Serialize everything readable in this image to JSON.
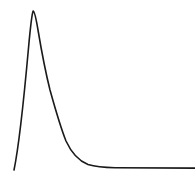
{
  "figure": {
    "name": "skewed-distribution-curve",
    "width": 195,
    "height": 178,
    "background_color": "#ffffff",
    "has_axes": false,
    "has_gridlines": false,
    "has_labels": false,
    "has_legend": false,
    "has_title": false,
    "title": "",
    "xlabel": "",
    "ylabel": ""
  },
  "style": {
    "stroke_color": "#1a1a1a",
    "stroke_width": 1.6,
    "background_color": "#ffffff"
  },
  "chart_data": {
    "type": "line",
    "title": "",
    "subtitle": "",
    "xlabel": "",
    "ylabel": "",
    "xlim": [
      0,
      195
    ],
    "ylim": [
      178,
      0
    ],
    "grid": false,
    "legend": null,
    "annotations": [],
    "tick_labels_x": [],
    "tick_labels_y": [],
    "series": [
      {
        "name": "density-curve",
        "color": "#1a1a1a",
        "x": [
          14,
          16,
          18,
          20,
          22,
          24,
          26,
          28,
          30,
          32,
          33,
          35,
          37,
          39,
          41,
          43,
          45,
          47,
          50,
          53,
          56,
          59,
          62,
          66,
          70,
          74,
          78,
          82,
          86,
          90,
          95,
          100,
          105,
          112,
          120,
          130,
          140,
          150,
          160,
          170,
          180,
          190,
          195
        ],
        "y": [
          170,
          152,
          130,
          106,
          82,
          60,
          42,
          28,
          18,
          12,
          11,
          13,
          20,
          29,
          39,
          48,
          56,
          64,
          76,
          87,
          98,
          108,
          118,
          130,
          139,
          147,
          153,
          157,
          161,
          163,
          165,
          166,
          166.6,
          167,
          167.2,
          167.4,
          167.5,
          167.6,
          167.7,
          167.8,
          167.8,
          167.9,
          167.9
        ]
      }
    ],
    "key_points": {
      "start": [
        14,
        170
      ],
      "peak": [
        33,
        11
      ],
      "knee": [
        90,
        163
      ],
      "tail_end": [
        195,
        168
      ],
      "asymptote_y": 167.9
    },
    "path_d": "M 14 170 C 19 146 24 98 28.5 48 C 30.5 26 32 13 33.2 11 C 34.5 11.5 36 18 38 30 C 41 48 45 70 50 90 C 55 108 60 126 66 141 C 72 154 79 161 88 164.6 C 96 167 104 167.6 115 167.8 L 195 168.1"
  }
}
